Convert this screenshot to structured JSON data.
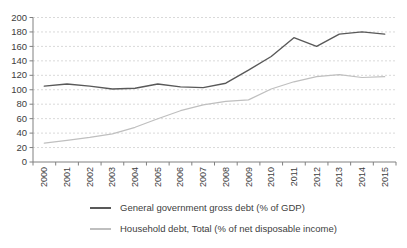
{
  "figure": {
    "background": "#ffffff"
  },
  "chart_data": {
    "type": "line",
    "title": "",
    "xlabel": "",
    "ylabel": "",
    "categories": [
      "2000",
      "2001",
      "2002",
      "2003",
      "2004",
      "2005",
      "2006",
      "2007",
      "2008",
      "2009",
      "2010",
      "2011",
      "2012",
      "2013",
      "2014",
      "2015"
    ],
    "series": [
      {
        "name": "General government gross debt (% of GDP)",
        "color": "#595959",
        "values": [
          105,
          108,
          105,
          101,
          102,
          108,
          104,
          103,
          109,
          127,
          146,
          172,
          160,
          177,
          180,
          177
        ]
      },
      {
        "name": "Household debt, Total (% of net disposable income)",
        "color": "#bfbfbf",
        "values": [
          26,
          30,
          34,
          39,
          48,
          60,
          71,
          79,
          84,
          86,
          101,
          111,
          118,
          121,
          117,
          118
        ]
      }
    ],
    "ylim": [
      0,
      200
    ],
    "ytick_step": 20,
    "ytick_labels": [
      "0",
      "20",
      "40",
      "60",
      "80",
      "100",
      "120",
      "140",
      "160",
      "180",
      "200"
    ],
    "grid": "horizontal-dashed",
    "legend_position": "bottom-left",
    "colors": {
      "axis": "#808080",
      "gridline": "#d9d9d9",
      "tick_label": "#404040"
    }
  }
}
